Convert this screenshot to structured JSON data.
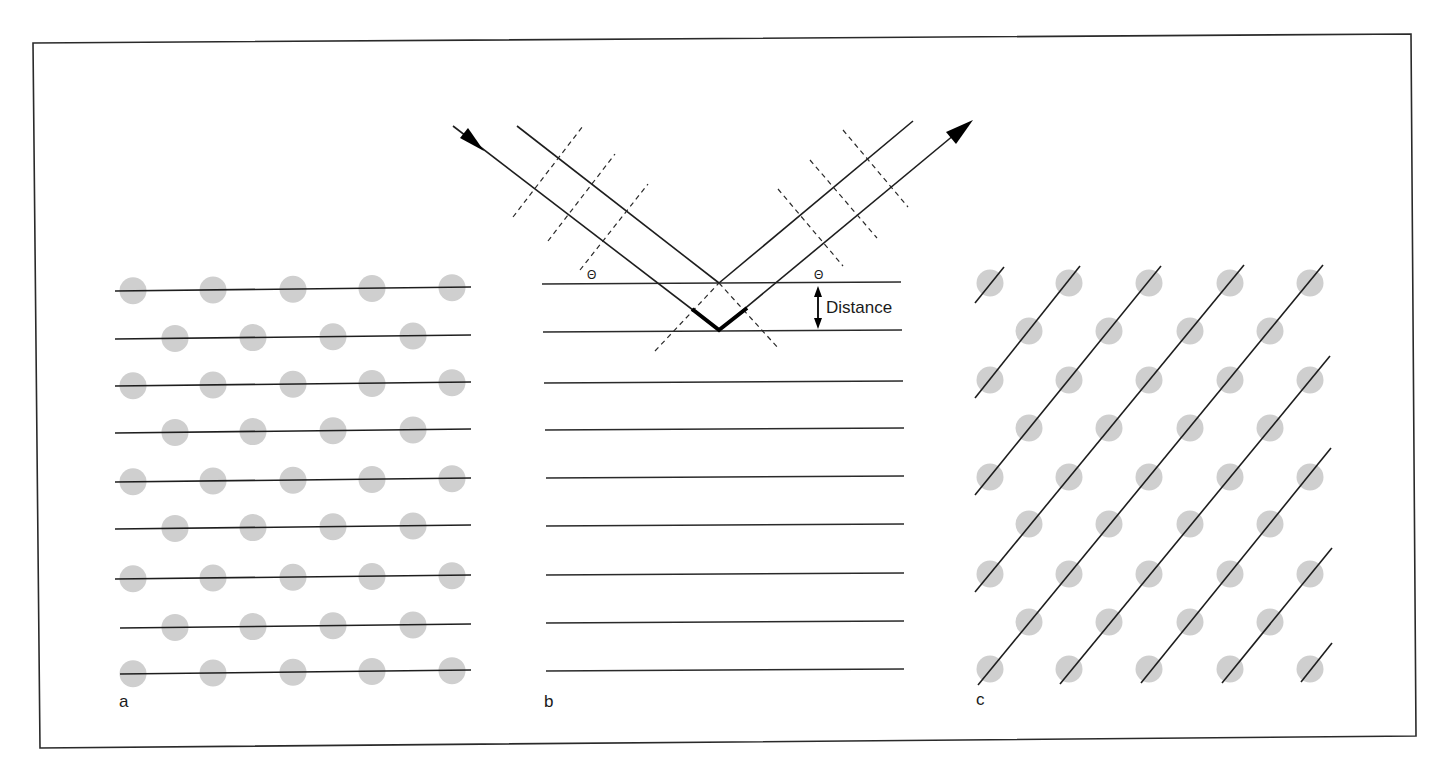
{
  "figure": {
    "panels": [
      {
        "id": "a",
        "label": "a",
        "description": "Crystal lattice with horizontal lattice planes"
      },
      {
        "id": "b",
        "label": "b",
        "description": "Bragg reflection from parallel planes"
      },
      {
        "id": "c",
        "label": "c",
        "description": "Same lattice with diagonal lattice planes"
      }
    ],
    "annotations": {
      "theta_left": "Θ",
      "theta_right": "Θ",
      "distance": "Distance"
    },
    "colors": {
      "lines": "#1e1e1e",
      "atoms": "#cfcfcf",
      "frame": "#2a2a2a"
    },
    "panel_a": {
      "rows_y": [
        290,
        338,
        385,
        432,
        481,
        528,
        578,
        627,
        673
      ],
      "atoms_per_row_even": 5,
      "atoms_per_row_odd": 4
    },
    "panel_b": {
      "planes_y": [
        283,
        331,
        382,
        429,
        477,
        525,
        574,
        622,
        670
      ]
    },
    "panel_c": {
      "rows_y": [
        283,
        331,
        380,
        428,
        477,
        524,
        574,
        622,
        669
      ]
    }
  }
}
